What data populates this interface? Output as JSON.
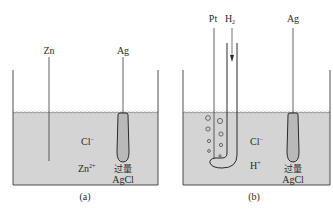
{
  "colors": {
    "liquid": "#d4d4d4",
    "line": "#3a3a3a",
    "agcl_fill": "#b9b9b9",
    "background": "#ffffff"
  },
  "cell_a": {
    "caption": "(a)",
    "electrode_left": "Zn",
    "electrode_right": "Ag",
    "ion_1": "Cl",
    "ion_1_charge": "−",
    "ion_2": "Zn",
    "ion_2_charge": "2+",
    "precipitate_note": "过量",
    "precipitate": "AgCl"
  },
  "cell_b": {
    "caption": "(b)",
    "electrode_left": "Pt",
    "gas_inlet": "H",
    "gas_inlet_sub": "2",
    "electrode_right": "Ag",
    "ion_1": "Cl",
    "ion_1_charge": "−",
    "ion_2": "H",
    "ion_2_charge": "+",
    "precipitate_note": "过量",
    "precipitate": "AgCl"
  }
}
